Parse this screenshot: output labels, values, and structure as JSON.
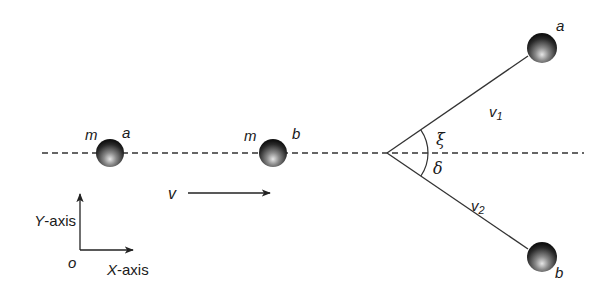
{
  "diagram": {
    "type": "two-body elastic collision (before/after)",
    "colors": {
      "line": "#333333",
      "ball_dark": "#1a1a1a",
      "ball_light": "#d9d9d9",
      "text": "#1a1a1a"
    },
    "before": {
      "ball_a": {
        "mass_label": "m",
        "name_label": "a"
      },
      "ball_b": {
        "mass_label": "m",
        "name_label": "b"
      },
      "velocity_label": "v"
    },
    "after": {
      "ball_a": {
        "name_label": "a",
        "velocity_label": "v",
        "velocity_sub": "1",
        "angle_label": "ξ"
      },
      "ball_b": {
        "name_label": "b",
        "velocity_label": "v",
        "velocity_sub": "2",
        "angle_label": "δ"
      }
    },
    "axes": {
      "origin_label": "o",
      "x_axis_label_letter": "X",
      "x_axis_label_rest": "-axis",
      "y_axis_label_letter": "Y",
      "y_axis_label_rest": "-axis"
    }
  }
}
